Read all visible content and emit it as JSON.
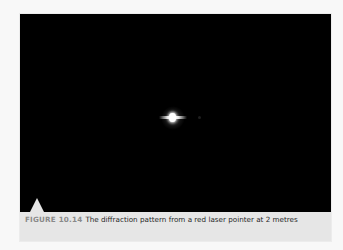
{
  "figure": {
    "label": "FIGURE 10.14",
    "caption": "The diffraction pattern from a red laser pointer at 2 metres",
    "photo": {
      "description": "Black background with a single bright central spot and short horizontal streaks",
      "background_color": "#000000",
      "spot_color": "#ffffff"
    },
    "colors": {
      "label": "#8a8a8a",
      "caption_text": "#262626",
      "caption_background": "#e6e6e6",
      "page_background": "#f8f8f8"
    }
  }
}
